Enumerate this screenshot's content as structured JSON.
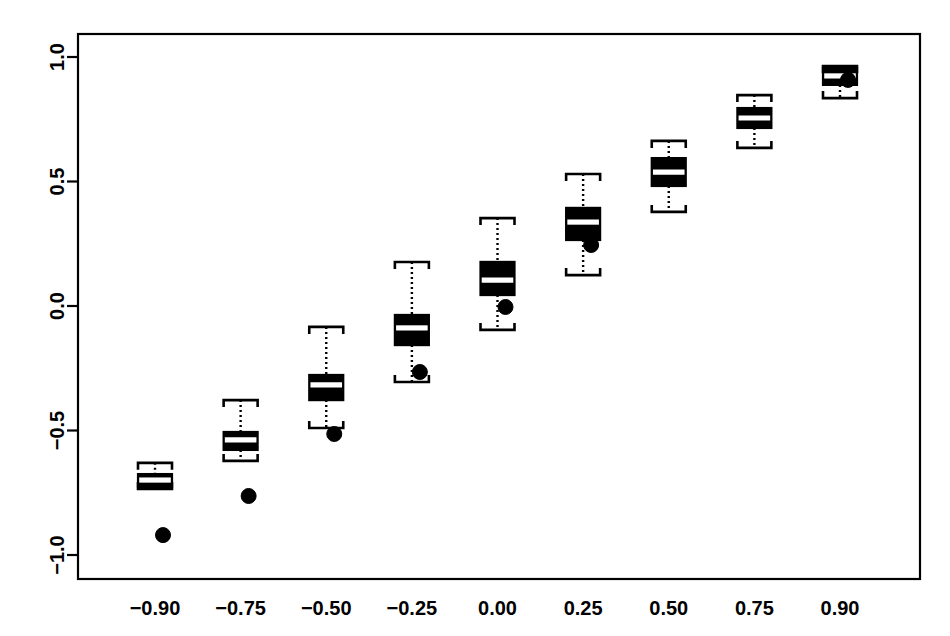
{
  "chart_data": {
    "type": "boxplot",
    "title": "",
    "xlabel": "",
    "ylabel": "",
    "xlim": [
      -1.0,
      1.0
    ],
    "ylim": [
      -1.15,
      1.12
    ],
    "grid": false,
    "legend": null,
    "categories": [
      "-0.90",
      "-0.75",
      "-0.50",
      "-0.25",
      "0.00",
      "0.25",
      "0.50",
      "0.75",
      "0.90"
    ],
    "xtick_labels": [
      "−0.90",
      "−0.75",
      "−0.50",
      "−0.25",
      "0.00",
      "0.25",
      "0.50",
      "0.75",
      "0.90"
    ],
    "ytick_labels": [
      "1.0",
      "0.5",
      "0.0",
      "−0.5",
      "−1.0"
    ],
    "ytick_values": [
      1.0,
      0.5,
      0.0,
      -0.5,
      -1.0
    ],
    "boxes": [
      {
        "category": "-0.90",
        "whisker_low": -0.735,
        "q1": -0.727,
        "median": -0.699,
        "q3": -0.675,
        "whisker_high": -0.63,
        "outliers": [
          -0.92
        ]
      },
      {
        "category": "-0.75",
        "whisker_low": -0.622,
        "q1": -0.578,
        "median": -0.538,
        "q3": -0.506,
        "whisker_high": -0.378,
        "outliers": [
          -0.763
        ]
      },
      {
        "category": "-0.50",
        "whisker_low": -0.49,
        "q1": -0.378,
        "median": -0.317,
        "q3": -0.277,
        "whisker_high": -0.084,
        "outliers": [
          -0.514
        ]
      },
      {
        "category": "-0.25",
        "whisker_low": -0.305,
        "q1": -0.157,
        "median": -0.088,
        "q3": -0.036,
        "whisker_high": 0.177,
        "outliers": [
          -0.265
        ]
      },
      {
        "category": "0.00",
        "whisker_low": -0.096,
        "q1": 0.044,
        "median": 0.104,
        "q3": 0.177,
        "whisker_high": 0.353,
        "outliers": [
          -0.004
        ]
      },
      {
        "category": "0.25",
        "whisker_low": 0.124,
        "q1": 0.265,
        "median": 0.337,
        "q3": 0.394,
        "whisker_high": 0.53,
        "outliers": [
          0.245
        ]
      },
      {
        "category": "0.50",
        "whisker_low": 0.378,
        "q1": 0.482,
        "median": 0.538,
        "q3": 0.594,
        "whisker_high": 0.663,
        "outliers": []
      },
      {
        "category": "0.75",
        "whisker_low": 0.635,
        "q1": 0.715,
        "median": 0.755,
        "q3": 0.795,
        "whisker_high": 0.847,
        "outliers": []
      },
      {
        "category": "0.90",
        "whisker_low": 0.835,
        "q1": 0.888,
        "median": 0.924,
        "q3": 0.956,
        "whisker_high": 0.964,
        "outliers": [
          0.908
        ]
      }
    ],
    "style": {
      "box_fill": "#000000",
      "box_edge": "#000000",
      "median_color": "#ffffff",
      "whisker_style": "dotted",
      "outlier_marker": "filled-circle",
      "frame_color": "#000000",
      "background": "#ffffff"
    }
  }
}
